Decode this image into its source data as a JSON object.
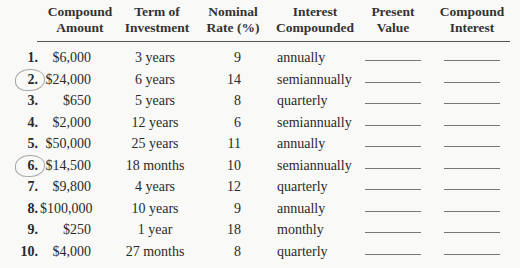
{
  "table": {
    "columns": [
      {
        "line1": "Compound",
        "line2": "Amount"
      },
      {
        "line1": "Term of",
        "line2": "Investment"
      },
      {
        "line1": "Nominal",
        "line2": "Rate (%)"
      },
      {
        "line1": "Interest",
        "line2": "Compounded"
      },
      {
        "line1": "Present",
        "line2": "Value"
      },
      {
        "line1": "Compound",
        "line2": "Interest"
      }
    ],
    "rows": [
      {
        "num": "1.",
        "amount": "$6,000",
        "term": "3 years",
        "rate": "9",
        "compounded": "annually",
        "present_value": "",
        "compound_interest": "",
        "circled": false
      },
      {
        "num": "2.",
        "amount": "$24,000",
        "term": "6 years",
        "rate": "14",
        "compounded": "semiannually",
        "present_value": "",
        "compound_interest": "",
        "circled": true
      },
      {
        "num": "3.",
        "amount": "$650",
        "term": "5 years",
        "rate": "8",
        "compounded": "quarterly",
        "present_value": "",
        "compound_interest": "",
        "circled": false
      },
      {
        "num": "4.",
        "amount": "$2,000",
        "term": "12 years",
        "rate": "6",
        "compounded": "semiannually",
        "present_value": "",
        "compound_interest": "",
        "circled": false
      },
      {
        "num": "5.",
        "amount": "$50,000",
        "term": "25 years",
        "rate": "11",
        "compounded": "annually",
        "present_value": "",
        "compound_interest": "",
        "circled": false
      },
      {
        "num": "6.",
        "amount": "$14,500",
        "term": "18 months",
        "rate": "10",
        "compounded": "semiannually",
        "present_value": "",
        "compound_interest": "",
        "circled": true
      },
      {
        "num": "7.",
        "amount": "$9,800",
        "term": "4 years",
        "rate": "12",
        "compounded": "quarterly",
        "present_value": "",
        "compound_interest": "",
        "circled": false
      },
      {
        "num": "8.",
        "amount": "$100,000",
        "term": "10 years",
        "rate": "9",
        "compounded": "annually",
        "present_value": "",
        "compound_interest": "",
        "circled": false
      },
      {
        "num": "9.",
        "amount": "$250",
        "term": "1 year",
        "rate": "18",
        "compounded": "monthly",
        "present_value": "",
        "compound_interest": "",
        "circled": false
      },
      {
        "num": "10.",
        "amount": "$4,000",
        "term": "27 months",
        "rate": "8",
        "compounded": "quarterly",
        "present_value": "",
        "compound_interest": "",
        "circled": false
      }
    ]
  }
}
